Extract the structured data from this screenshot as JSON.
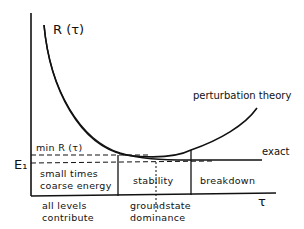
{
  "diagram": {
    "y_label": "R (τ)",
    "x_label": "τ",
    "e1_label": "E₁",
    "min_label": "min R (τ)",
    "curves": {
      "perturbation": "perturbation theory",
      "exact": "exact"
    },
    "regions": [
      {
        "box": "small times",
        "box2": "coarse energy",
        "below": "all levels",
        "below2": "contribute"
      },
      {
        "box": "stability",
        "below": "groundstate",
        "below2": "dominance"
      },
      {
        "box": "breakdown"
      }
    ],
    "colors": {
      "ink": "#111111",
      "background": "#ffffff"
    }
  }
}
